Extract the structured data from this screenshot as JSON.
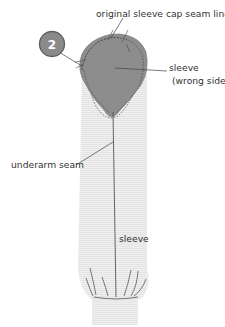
{
  "diagram": {
    "step_badge": "2",
    "labels": {
      "seam_line": "original sleeve cap seam line",
      "sleeve_wrong_side_1": "sleeve",
      "sleeve_wrong_side_2": "(wrong side)",
      "underarm_seam": "underarm seam",
      "sleeve": "sleeve"
    },
    "colors": {
      "sleeve_fill": "#ececec",
      "cap_fill": "#8c8c8c",
      "badge_fill": "#8a8a8a",
      "badge_stroke": "#5a5a5a",
      "line": "#444444",
      "text": "#333333"
    }
  }
}
